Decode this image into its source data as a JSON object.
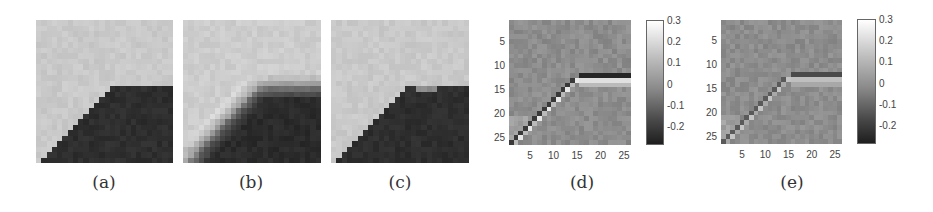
{
  "figure": {
    "grid_size": 26,
    "panels": [
      {
        "id": "a",
        "caption": "(a)",
        "kind": "image",
        "description": "clean step edge",
        "x": 36,
        "y": 20,
        "w": 137,
        "h": 143,
        "caption_x": 104,
        "light": "#c9c9c9",
        "dark": "#2e2e2e"
      },
      {
        "id": "b",
        "caption": "(b)",
        "kind": "image",
        "description": "blurred edge with halo",
        "x": 183,
        "y": 20,
        "w": 138,
        "h": 143,
        "caption_x": 251,
        "light": "#cdcdcd",
        "dark": "#2b2b2b"
      },
      {
        "id": "c",
        "caption": "(c)",
        "kind": "image",
        "description": "restored edge",
        "x": 331,
        "y": 20,
        "w": 138,
        "h": 143,
        "caption_x": 400,
        "light": "#c9c9c9",
        "dark": "#2e2e2e"
      },
      {
        "id": "d",
        "caption": "(d)",
        "kind": "difference",
        "description": "difference map with colorbar",
        "x": 509,
        "y": 20,
        "w": 122,
        "h": 125,
        "caption_x": 582,
        "colorbar": {
          "x": 646,
          "y": 20,
          "w": 18,
          "h": 125
        },
        "yticks": [
          "5",
          "10",
          "15",
          "20",
          "25"
        ],
        "xticks": [
          "5",
          "10",
          "15",
          "20",
          "25"
        ],
        "strength": 1.0
      },
      {
        "id": "e",
        "caption": "(e)",
        "kind": "difference",
        "description": "difference map with colorbar",
        "x": 721,
        "y": 20,
        "w": 121,
        "h": 124,
        "caption_x": 792,
        "colorbar": {
          "x": 857,
          "y": 19,
          "w": 19,
          "h": 125
        },
        "yticks": [
          "5",
          "10",
          "15",
          "20",
          "25"
        ],
        "xticks": [
          "5",
          "10",
          "15",
          "20",
          "25"
        ],
        "strength": 0.6
      }
    ],
    "colorbar_labels": [
      "0.3",
      "0.2",
      "0.1",
      "0",
      "-0.1",
      "-0.2"
    ],
    "colorbar_range": [
      -0.29,
      0.3
    ],
    "background_gray": "#8c8c8c"
  },
  "chart_data": [
    {
      "type": "heatmap",
      "title": "(d)",
      "xlabel": "",
      "ylabel": "",
      "x_ticks": [
        5,
        10,
        15,
        20,
        25
      ],
      "y_ticks": [
        5,
        10,
        15,
        20,
        25
      ],
      "grid": [
        26,
        26
      ],
      "colorbar": {
        "ticks": [
          0.3,
          0.2,
          0.1,
          0,
          -0.1,
          -0.2
        ],
        "range": [
          -0.29,
          0.3
        ]
      },
      "features": "diagonal edge from (2,26) to (15,13) then horizontal edge at rows 12-14 to column 26; alternating dark (-0.25) / bright (+0.25) pixels along edge"
    },
    {
      "type": "heatmap",
      "title": "(e)",
      "xlabel": "",
      "ylabel": "",
      "x_ticks": [
        5,
        10,
        15,
        20,
        25
      ],
      "y_ticks": [
        5,
        10,
        15,
        20,
        25
      ],
      "grid": [
        26,
        26
      ],
      "colorbar": {
        "ticks": [
          0.3,
          0.2,
          0.1,
          0,
          -0.1,
          -0.2
        ],
        "range": [
          -0.29,
          0.3
        ]
      },
      "features": "same edge structure as (d) with weaker residuals (~±0.15)"
    }
  ]
}
